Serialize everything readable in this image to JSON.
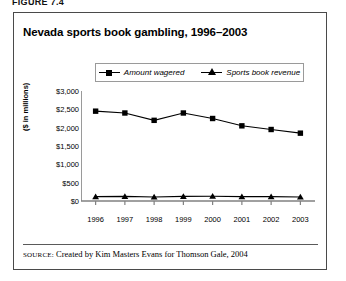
{
  "figure": {
    "number": "FIGURE 7.4"
  },
  "chart_title": "Nevada sports book gambling, 1996–2003",
  "source": {
    "label": "SOURCE:",
    "text": "Created by Kim Masters Evans for Thomson Gale, 2004"
  },
  "chart_data": {
    "type": "line",
    "title": "Nevada sports book gambling, 1996–2003",
    "xlabel": "",
    "ylabel": "($ in millions)",
    "categories": [
      "1996",
      "1997",
      "1998",
      "1999",
      "2000",
      "2001",
      "2002",
      "2003"
    ],
    "series": [
      {
        "name": "Amount wagered",
        "marker": "square",
        "values": [
          2450,
          2400,
          2200,
          2400,
          2250,
          2050,
          1950,
          1850
        ]
      },
      {
        "name": "Sports book revenue",
        "marker": "triangle",
        "values": [
          120,
          125,
          110,
          125,
          130,
          120,
          120,
          110
        ]
      }
    ],
    "ylim": [
      0,
      3000
    ],
    "yticks": [
      0,
      500,
      1000,
      1500,
      2000,
      2500,
      3000
    ],
    "ytick_labels": [
      "$0",
      "$500",
      "$1,000",
      "$1,500",
      "$2,000",
      "$2,500",
      "$3,000"
    ],
    "grid": false,
    "legend_position": "top",
    "line_color": "#000000",
    "axis_color": "#808080"
  }
}
